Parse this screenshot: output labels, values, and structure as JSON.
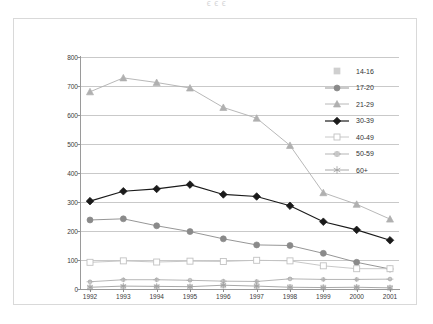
{
  "title_remnant": "ϵ                      ϵ  ϵ",
  "chart_data": {
    "type": "line",
    "title": "",
    "xlabel": "",
    "ylabel": "",
    "x": [
      1992,
      1993,
      1994,
      1995,
      1996,
      1997,
      1998,
      1999,
      2000,
      2001
    ],
    "categories": [
      "1992",
      "1993",
      "1994",
      "1995",
      "1996",
      "1997",
      "1998",
      "1999",
      "2000",
      "2001"
    ],
    "ylim": [
      0,
      800
    ],
    "yticks": [
      0,
      100,
      200,
      300,
      400,
      500,
      600,
      700,
      800
    ],
    "ytick_labels": [
      "0",
      "100",
      "200",
      "300",
      "400",
      "500",
      "600",
      "700",
      "800"
    ],
    "grid": true,
    "legend_position": "top-right",
    "series": [
      {
        "name": "14-16",
        "label": "14-16",
        "color": "#cfcfcf",
        "marker": "square-filled",
        "line": false,
        "values": [
          5,
          6,
          6,
          7,
          12,
          10,
          6,
          5,
          5,
          4
        ]
      },
      {
        "name": "17-20",
        "label": "17-20",
        "color": "#8a8a8a",
        "marker": "circle-filled",
        "line": true,
        "values": [
          238,
          242,
          218,
          198,
          173,
          152,
          150,
          123,
          92,
          69
        ]
      },
      {
        "name": "21-29",
        "label": "21-29",
        "color": "#b0b0b0",
        "marker": "triangle-filled",
        "line": true,
        "values": [
          680,
          728,
          712,
          693,
          626,
          589,
          495,
          332,
          292,
          241
        ]
      },
      {
        "name": "30-39",
        "label": "30-39",
        "color": "#1a1a1a",
        "marker": "diamond-filled",
        "line": true,
        "values": [
          303,
          337,
          345,
          360,
          326,
          319,
          287,
          232,
          204,
          168
        ]
      },
      {
        "name": "40-49",
        "label": "40-49",
        "color": "#c2c2c2",
        "marker": "square-open",
        "line": true,
        "values": [
          92,
          97,
          93,
          96,
          95,
          99,
          97,
          80,
          70,
          70
        ]
      },
      {
        "name": "50-59",
        "label": "50-59",
        "color": "#adadad",
        "marker": "plus-open",
        "line": true,
        "values": [
          25,
          32,
          32,
          30,
          27,
          26,
          35,
          33,
          33,
          34
        ]
      },
      {
        "name": "60+",
        "label": "60+",
        "color": "#9e9e9e",
        "marker": "star-open",
        "line": true,
        "values": [
          6,
          10,
          9,
          8,
          13,
          10,
          6,
          5,
          6,
          4
        ]
      }
    ]
  }
}
